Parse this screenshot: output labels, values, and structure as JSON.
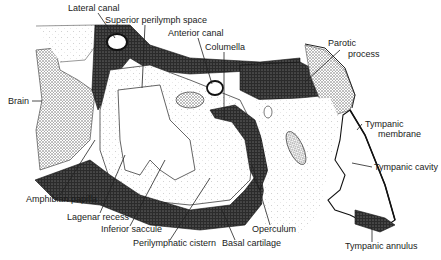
{
  "figure": {
    "colors": {
      "background": "#ffffff",
      "ink": "#1a1a1a",
      "dense_stipple": "#2b2b2b",
      "light_stipple": "#d9d9d9",
      "medium_stipple": "#9a9a9a"
    },
    "labels": [
      {
        "id": "lateral-canal",
        "text": "Lateral canal",
        "x": 68,
        "y": 11
      },
      {
        "id": "superior-perilymph-space",
        "text": "Superior perilymph space",
        "x": 105,
        "y": 23
      },
      {
        "id": "anterior-canal",
        "text": "Anterior canal",
        "x": 168,
        "y": 36
      },
      {
        "id": "columella",
        "text": "Columella",
        "x": 205,
        "y": 50
      },
      {
        "id": "parotic-process",
        "text": "Parotic",
        "x": 328,
        "y": 46
      },
      {
        "id": "parotic-process-2",
        "text": "process",
        "x": 348,
        "y": 57
      },
      {
        "id": "brain",
        "text": "Brain",
        "x": 8,
        "y": 104
      },
      {
        "id": "tympanic-membrane",
        "text": "Tympanic",
        "x": 365,
        "y": 127
      },
      {
        "id": "tympanic-membrane-2",
        "text": "membrane",
        "x": 378,
        "y": 137
      },
      {
        "id": "tympanic-cavity",
        "text": "Tympanic cavity",
        "x": 374,
        "y": 170
      },
      {
        "id": "amphibian-papilla",
        "text": "Amphibian papilla",
        "x": 26,
        "y": 202
      },
      {
        "id": "lagenar-recess",
        "text": "Lagenar recess",
        "x": 67,
        "y": 220
      },
      {
        "id": "inferior-saccule",
        "text": "Inferior saccule",
        "x": 101,
        "y": 232
      },
      {
        "id": "operculum",
        "text": "Operculum",
        "x": 252,
        "y": 232
      },
      {
        "id": "perilymphatic-cistern",
        "text": "Perilymphatic cistern",
        "x": 133,
        "y": 246
      },
      {
        "id": "basal-cartilage",
        "text": "Basal cartilage",
        "x": 222,
        "y": 246
      },
      {
        "id": "tympanic-annulus",
        "text": "Tympanic annulus",
        "x": 345,
        "y": 249
      }
    ]
  }
}
